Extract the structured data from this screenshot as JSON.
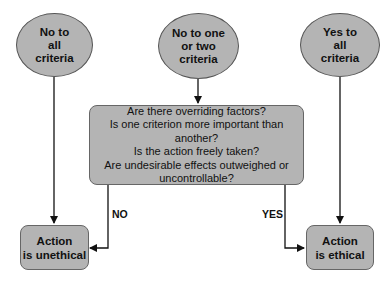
{
  "nodes": {
    "left_start": "No to\nall\ncriteria",
    "middle_start": "No to one\nor two\ncriteria",
    "right_start": "Yes to\nall\ncriteria",
    "decision": "Are there overriding factors?\nIs one criterion more important than another?\nIs the action freely taken?\nAre undesirable effects outweighed or\nuncontrollable?",
    "unethical": "Action\nis unethical",
    "ethical": "Action\nis ethical"
  },
  "edges": {
    "no_label": "NO",
    "yes_label": "YES"
  },
  "colors": {
    "node_fill": "#b4b4b4",
    "line": "#111111"
  }
}
